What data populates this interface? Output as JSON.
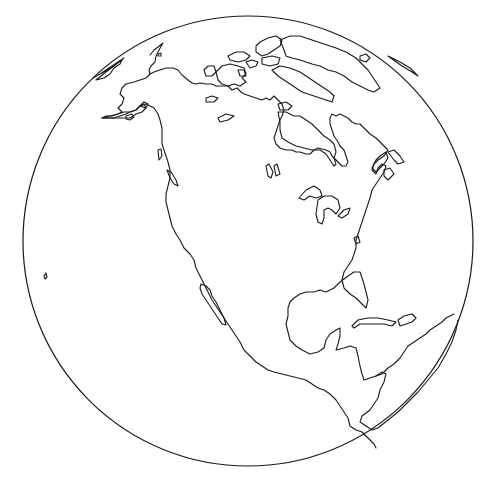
{
  "map": {
    "projection": "orthographic",
    "style": "outline",
    "region_in_view": "North America",
    "colors": {
      "background": "#ffffff",
      "land": "#ffffff",
      "ocean": "#ffffff",
      "coastline": "#1a1a1a",
      "globe_edge": "#1a1a1a"
    },
    "globe": {
      "cx": 248,
      "cy": 241,
      "r": 225
    },
    "features": [
      "alaska",
      "canada",
      "canadian-arctic-archipelago",
      "greenland",
      "hudson-bay",
      "great-lakes",
      "lake-winnipeg",
      "gulf-of-st-lawrence",
      "newfoundland",
      "contiguous-united-states",
      "florida",
      "gulf-of-mexico",
      "baja-california",
      "gulf-of-california",
      "mexico",
      "yucatan-peninsula",
      "central-america",
      "cuba",
      "hispaniola",
      "northern-south-america",
      "hawaii-island",
      "vancouver-island",
      "iceland-edge"
    ],
    "labels": []
  }
}
